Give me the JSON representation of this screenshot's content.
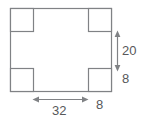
{
  "diagram": {
    "type": "geometry-figure",
    "colors": {
      "stroke": "#808285",
      "fill": "#ffffff",
      "arrow": "#808285",
      "text": "#58585a",
      "background": "#ffffff"
    },
    "shape": {
      "name": "notched-rectangle",
      "outer": {
        "x": 10,
        "y": 8,
        "width": 102,
        "height": 84
      },
      "notches": [
        {
          "name": "notch-top-left",
          "x": 10,
          "y": 8,
          "width": 24,
          "height": 24
        },
        {
          "name": "notch-top-right",
          "x": 88,
          "y": 8,
          "width": 24,
          "height": 24
        },
        {
          "name": "notch-bottom-left",
          "x": 10,
          "y": 68,
          "width": 24,
          "height": 24
        },
        {
          "name": "notch-bottom-right",
          "x": 88,
          "y": 68,
          "width": 24,
          "height": 24
        }
      ]
    },
    "dimensions": [
      {
        "id": "height-20",
        "value": "20",
        "orientation": "vertical",
        "arrow": "double",
        "measures": "middle vertical span between the notches on the right side"
      },
      {
        "id": "height-8",
        "value": "8",
        "orientation": "vertical",
        "arrow": "none",
        "measures": "height of the bottom-right corner notch"
      },
      {
        "id": "width-32",
        "value": "32",
        "orientation": "horizontal",
        "arrow": "double",
        "measures": "middle horizontal span between the notches along the bottom"
      },
      {
        "id": "width-8",
        "value": "8",
        "orientation": "horizontal",
        "arrow": "none",
        "measures": "width of the bottom-right corner notch"
      }
    ]
  }
}
